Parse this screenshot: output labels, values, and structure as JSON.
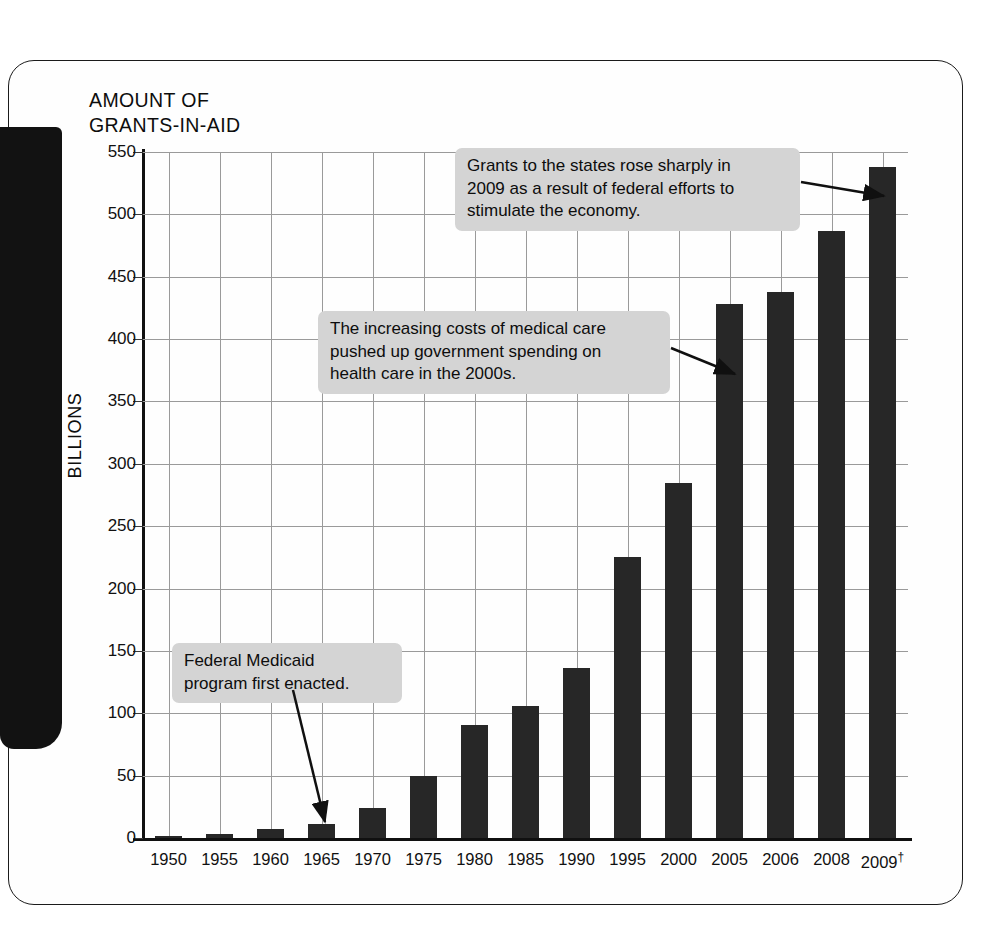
{
  "figure": {
    "title": "AMOUNT OF\nGRANTS-IN-AID",
    "ylabel": "BILLIONS"
  },
  "chart_data": {
    "type": "bar",
    "title": "AMOUNT OF GRANTS-IN-AID",
    "xlabel": "",
    "ylabel": "BILLIONS",
    "ylim": [
      0,
      550
    ],
    "ytick_step": 50,
    "grid": true,
    "legend": "none",
    "bar_color": "#272727",
    "categories": [
      "1950",
      "1955",
      "1960",
      "1965",
      "1970",
      "1975",
      "1980",
      "1985",
      "1990",
      "1995",
      "2000",
      "2005",
      "2006",
      "2008",
      "2009†"
    ],
    "values": [
      2,
      3,
      7,
      11,
      24,
      50,
      91,
      106,
      136,
      225,
      285,
      428,
      438,
      487,
      538
    ],
    "ytick_labels": [
      "0",
      "50",
      "100",
      "150",
      "200",
      "250",
      "300",
      "350",
      "400",
      "450",
      "500",
      "550"
    ],
    "annotations": [
      {
        "text": "Grants to the states rose sharply in\n2009 as a result of federal efforts to\nstimulate the economy.",
        "points_to": "2009†"
      },
      {
        "text": "The increasing costs of medical care\npushed up government spending on\nhealth care in the 2000s.",
        "points_to": "2005"
      },
      {
        "text": "Federal Medicaid\nprogram first enacted.",
        "points_to": "1965"
      }
    ]
  }
}
